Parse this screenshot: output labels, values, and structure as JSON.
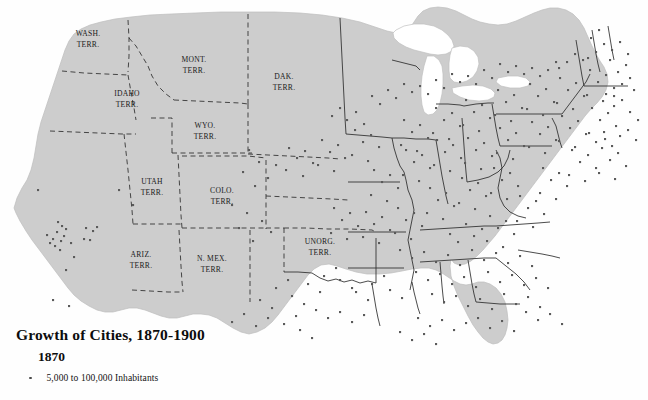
{
  "map": {
    "title": "Growth of Cities, 1870-1900",
    "year": "1870",
    "legend": {
      "dot_icon": "city-dot-icon",
      "entry_label": "5,000 to 100,000 Inhabitants"
    },
    "colors": {
      "land": "#cdcdcd",
      "land_edge": "#b4b4b4",
      "water": "#ffffff",
      "lake_outline": "#bcbcbc",
      "border_dashed": "#2a2a2a",
      "border_solid": "#2f2f2f",
      "city_dot": "#5a5a5a",
      "text": "#1a1a1a"
    },
    "territories": [
      {
        "name": "wash-terr",
        "line1": "WASH.",
        "line2": "TERR.",
        "x": 88,
        "y": 36
      },
      {
        "name": "idaho-terr",
        "line1": "IDAHO",
        "line2": "TERR.",
        "x": 127,
        "y": 96
      },
      {
        "name": "mont-terr",
        "line1": "MONT.",
        "line2": "TERR.",
        "x": 194,
        "y": 62
      },
      {
        "name": "dak-terr",
        "line1": "DAK.",
        "line2": "TERR.",
        "x": 284,
        "y": 79
      },
      {
        "name": "wyo-terr",
        "line1": "WYO.",
        "line2": "TERR.",
        "x": 205,
        "y": 128
      },
      {
        "name": "utah-terr",
        "line1": "UTAH",
        "line2": "TERR.",
        "x": 152,
        "y": 184
      },
      {
        "name": "colo-terr",
        "line1": "COLO.",
        "line2": "TERR.",
        "x": 222,
        "y": 193
      },
      {
        "name": "ariz-terr",
        "line1": "ARIZ.",
        "line2": "TERR.",
        "x": 141,
        "y": 257
      },
      {
        "name": "nmex-terr",
        "line1": "N. MEX.",
        "line2": "TERR.",
        "x": 212,
        "y": 261
      },
      {
        "name": "unorg-terr",
        "line1": "UNORG.",
        "line2": "TERR.",
        "x": 320,
        "y": 244
      }
    ],
    "city_dots": [
      [
        47,
        235
      ],
      [
        53,
        239
      ],
      [
        57,
        232
      ],
      [
        61,
        241
      ],
      [
        64,
        236
      ],
      [
        55,
        246
      ],
      [
        50,
        243
      ],
      [
        66,
        229
      ],
      [
        60,
        250
      ],
      [
        71,
        243
      ],
      [
        86,
        228
      ],
      [
        93,
        231
      ],
      [
        97,
        227
      ],
      [
        84,
        239
      ],
      [
        58,
        222
      ],
      [
        62,
        226
      ],
      [
        90,
        240
      ],
      [
        74,
        257
      ],
      [
        66,
        270
      ],
      [
        38,
        190
      ],
      [
        69,
        306
      ],
      [
        53,
        300
      ],
      [
        119,
        190
      ],
      [
        133,
        205
      ],
      [
        249,
        150
      ],
      [
        259,
        162
      ],
      [
        243,
        172
      ],
      [
        268,
        178
      ],
      [
        255,
        186
      ],
      [
        276,
        165
      ],
      [
        232,
        205
      ],
      [
        247,
        213
      ],
      [
        262,
        221
      ],
      [
        239,
        228
      ],
      [
        271,
        232
      ],
      [
        253,
        241
      ],
      [
        289,
        148
      ],
      [
        297,
        158
      ],
      [
        305,
        151
      ],
      [
        313,
        163
      ],
      [
        286,
        170
      ],
      [
        303,
        176
      ],
      [
        322,
        140
      ],
      [
        330,
        152
      ],
      [
        338,
        145
      ],
      [
        345,
        158
      ],
      [
        318,
        165
      ],
      [
        334,
        171
      ],
      [
        355,
        130
      ],
      [
        363,
        142
      ],
      [
        371,
        135
      ],
      [
        379,
        147
      ],
      [
        352,
        155
      ],
      [
        368,
        161
      ],
      [
        347,
        120
      ],
      [
        356,
        112
      ],
      [
        340,
        108
      ],
      [
        364,
        124
      ],
      [
        332,
        116
      ],
      [
        374,
        170
      ],
      [
        382,
        182
      ],
      [
        390,
        175
      ],
      [
        398,
        188
      ],
      [
        371,
        195
      ],
      [
        387,
        201
      ],
      [
        406,
        150
      ],
      [
        414,
        162
      ],
      [
        422,
        155
      ],
      [
        430,
        168
      ],
      [
        403,
        175
      ],
      [
        419,
        181
      ],
      [
        437,
        140
      ],
      [
        445,
        152
      ],
      [
        453,
        145
      ],
      [
        461,
        158
      ],
      [
        434,
        165
      ],
      [
        450,
        171
      ],
      [
        404,
        120
      ],
      [
        412,
        132
      ],
      [
        420,
        125
      ],
      [
        428,
        138
      ],
      [
        401,
        145
      ],
      [
        417,
        151
      ],
      [
        436,
        108
      ],
      [
        444,
        120
      ],
      [
        452,
        113
      ],
      [
        460,
        126
      ],
      [
        433,
        133
      ],
      [
        449,
        139
      ],
      [
        466,
        100
      ],
      [
        474,
        112
      ],
      [
        482,
        105
      ],
      [
        490,
        118
      ],
      [
        463,
        125
      ],
      [
        479,
        131
      ],
      [
        468,
        138
      ],
      [
        476,
        150
      ],
      [
        484,
        143
      ],
      [
        492,
        156
      ],
      [
        465,
        163
      ],
      [
        481,
        169
      ],
      [
        498,
        90
      ],
      [
        506,
        102
      ],
      [
        514,
        95
      ],
      [
        522,
        108
      ],
      [
        495,
        115
      ],
      [
        511,
        121
      ],
      [
        500,
        128
      ],
      [
        508,
        140
      ],
      [
        516,
        133
      ],
      [
        524,
        146
      ],
      [
        497,
        153
      ],
      [
        513,
        159
      ],
      [
        530,
        84
      ],
      [
        538,
        96
      ],
      [
        546,
        89
      ],
      [
        554,
        102
      ],
      [
        527,
        109
      ],
      [
        543,
        115
      ],
      [
        532,
        122
      ],
      [
        540,
        134
      ],
      [
        548,
        127
      ],
      [
        556,
        140
      ],
      [
        529,
        147
      ],
      [
        545,
        153
      ],
      [
        560,
        78
      ],
      [
        568,
        90
      ],
      [
        576,
        83
      ],
      [
        584,
        96
      ],
      [
        557,
        103
      ],
      [
        573,
        109
      ],
      [
        562,
        116
      ],
      [
        570,
        128
      ],
      [
        578,
        121
      ],
      [
        586,
        134
      ],
      [
        559,
        141
      ],
      [
        575,
        147
      ],
      [
        590,
        70
      ],
      [
        598,
        82
      ],
      [
        606,
        75
      ],
      [
        614,
        88
      ],
      [
        587,
        95
      ],
      [
        603,
        101
      ],
      [
        592,
        108
      ],
      [
        600,
        120
      ],
      [
        608,
        113
      ],
      [
        616,
        126
      ],
      [
        589,
        133
      ],
      [
        605,
        139
      ],
      [
        610,
        60
      ],
      [
        618,
        72
      ],
      [
        626,
        65
      ],
      [
        622,
        84
      ],
      [
        614,
        96
      ],
      [
        630,
        78
      ],
      [
        596,
        52
      ],
      [
        604,
        44
      ],
      [
        612,
        50
      ],
      [
        588,
        58
      ],
      [
        620,
        42
      ],
      [
        628,
        54
      ],
      [
        567,
        62
      ],
      [
        575,
        54
      ],
      [
        583,
        60
      ],
      [
        559,
        68
      ],
      [
        591,
        38
      ],
      [
        599,
        30
      ],
      [
        548,
        70
      ],
      [
        556,
        62
      ],
      [
        540,
        76
      ],
      [
        532,
        68
      ],
      [
        524,
        74
      ],
      [
        516,
        66
      ],
      [
        508,
        72
      ],
      [
        500,
        64
      ],
      [
        492,
        78
      ],
      [
        484,
        70
      ],
      [
        476,
        84
      ],
      [
        468,
        76
      ],
      [
        460,
        82
      ],
      [
        452,
        74
      ],
      [
        444,
        88
      ],
      [
        436,
        80
      ],
      [
        428,
        94
      ],
      [
        420,
        86
      ],
      [
        412,
        92
      ],
      [
        404,
        84
      ],
      [
        396,
        98
      ],
      [
        388,
        90
      ],
      [
        380,
        104
      ],
      [
        372,
        96
      ],
      [
        494,
        168
      ],
      [
        502,
        180
      ],
      [
        510,
        173
      ],
      [
        518,
        186
      ],
      [
        491,
        193
      ],
      [
        507,
        199
      ],
      [
        462,
        178
      ],
      [
        470,
        190
      ],
      [
        478,
        183
      ],
      [
        486,
        196
      ],
      [
        459,
        203
      ],
      [
        475,
        209
      ],
      [
        430,
        188
      ],
      [
        438,
        200
      ],
      [
        446,
        193
      ],
      [
        454,
        206
      ],
      [
        427,
        213
      ],
      [
        443,
        219
      ],
      [
        398,
        208
      ],
      [
        406,
        220
      ],
      [
        414,
        213
      ],
      [
        422,
        226
      ],
      [
        395,
        233
      ],
      [
        411,
        239
      ],
      [
        366,
        212
      ],
      [
        374,
        224
      ],
      [
        382,
        217
      ],
      [
        390,
        230
      ],
      [
        363,
        237
      ],
      [
        379,
        243
      ],
      [
        334,
        208
      ],
      [
        342,
        220
      ],
      [
        350,
        213
      ],
      [
        358,
        226
      ],
      [
        331,
        233
      ],
      [
        347,
        239
      ],
      [
        400,
        250
      ],
      [
        412,
        258
      ],
      [
        424,
        252
      ],
      [
        436,
        262
      ],
      [
        448,
        255
      ],
      [
        460,
        265
      ],
      [
        472,
        250
      ],
      [
        484,
        260
      ],
      [
        496,
        253
      ],
      [
        508,
        263
      ],
      [
        520,
        256
      ],
      [
        532,
        266
      ],
      [
        416,
        272
      ],
      [
        428,
        280
      ],
      [
        440,
        274
      ],
      [
        452,
        284
      ],
      [
        464,
        277
      ],
      [
        476,
        287
      ],
      [
        488,
        272
      ],
      [
        500,
        282
      ],
      [
        512,
        275
      ],
      [
        524,
        285
      ],
      [
        536,
        278
      ],
      [
        548,
        288
      ],
      [
        432,
        294
      ],
      [
        444,
        302
      ],
      [
        456,
        296
      ],
      [
        468,
        306
      ],
      [
        480,
        299
      ],
      [
        492,
        309
      ],
      [
        504,
        294
      ],
      [
        516,
        304
      ],
      [
        528,
        297
      ],
      [
        540,
        307
      ],
      [
        390,
        290
      ],
      [
        402,
        298
      ],
      [
        372,
        284
      ],
      [
        384,
        276
      ],
      [
        356,
        292
      ],
      [
        368,
        300
      ],
      [
        340,
        280
      ],
      [
        352,
        288
      ],
      [
        324,
        276
      ],
      [
        336,
        268
      ],
      [
        308,
        284
      ],
      [
        320,
        292
      ],
      [
        292,
        296
      ],
      [
        304,
        304
      ],
      [
        276,
        288
      ],
      [
        288,
        280
      ],
      [
        260,
        300
      ],
      [
        272,
        308
      ],
      [
        316,
        310
      ],
      [
        328,
        318
      ],
      [
        340,
        312
      ],
      [
        352,
        322
      ],
      [
        364,
        315
      ],
      [
        300,
        330
      ],
      [
        312,
        338
      ],
      [
        284,
        324
      ],
      [
        296,
        316
      ],
      [
        268,
        318
      ],
      [
        256,
        326
      ],
      [
        244,
        314
      ],
      [
        232,
        322
      ],
      [
        418,
        318
      ],
      [
        430,
        326
      ],
      [
        442,
        320
      ],
      [
        454,
        330
      ],
      [
        466,
        323
      ],
      [
        478,
        318
      ],
      [
        490,
        328
      ],
      [
        502,
        321
      ],
      [
        514,
        331
      ],
      [
        400,
        332
      ],
      [
        412,
        340
      ],
      [
        424,
        334
      ],
      [
        436,
        344
      ],
      [
        526,
        312
      ],
      [
        538,
        320
      ],
      [
        550,
        314
      ],
      [
        562,
        324
      ],
      [
        572,
        150
      ],
      [
        580,
        162
      ],
      [
        588,
        155
      ],
      [
        596,
        168
      ],
      [
        569,
        175
      ],
      [
        585,
        181
      ],
      [
        602,
        148
      ],
      [
        610,
        160
      ],
      [
        618,
        153
      ],
      [
        626,
        166
      ],
      [
        599,
        173
      ],
      [
        615,
        179
      ],
      [
        543,
        168
      ],
      [
        551,
        180
      ],
      [
        559,
        173
      ],
      [
        567,
        186
      ],
      [
        540,
        193
      ],
      [
        556,
        199
      ],
      [
        520,
        196
      ],
      [
        528,
        208
      ],
      [
        536,
        201
      ],
      [
        544,
        214
      ],
      [
        517,
        221
      ],
      [
        533,
        227
      ],
      [
        490,
        216
      ],
      [
        498,
        228
      ],
      [
        506,
        221
      ],
      [
        514,
        234
      ],
      [
        487,
        241
      ],
      [
        503,
        247
      ],
      [
        466,
        224
      ],
      [
        474,
        236
      ],
      [
        482,
        229
      ],
      [
        458,
        242
      ],
      [
        450,
        234
      ],
      [
        622,
        100
      ],
      [
        630,
        112
      ],
      [
        614,
        106
      ],
      [
        606,
        94
      ],
      [
        634,
        90
      ],
      [
        638,
        120
      ],
      [
        628,
        130
      ],
      [
        636,
        140
      ],
      [
        620,
        136
      ],
      [
        612,
        146
      ],
      [
        604,
        132
      ],
      [
        596,
        142
      ]
    ]
  }
}
